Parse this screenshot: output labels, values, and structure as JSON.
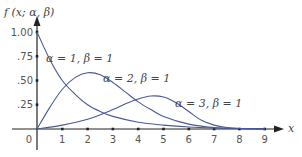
{
  "chart_data": {
    "type": "line",
    "title": "",
    "ylabel": "f (x; α, β)",
    "xlabel": "x",
    "xlim": [
      0,
      9
    ],
    "ylim": [
      0,
      1.1
    ],
    "grid": false,
    "legend_position": "inline annotations",
    "x_ticks": [
      "0",
      "1",
      "2",
      "3",
      "4",
      "5",
      "6",
      "7",
      "8",
      "9"
    ],
    "y_ticks": [
      ".25",
      ".50",
      ".75",
      "1.00"
    ],
    "y_tick_values": [
      0.25,
      0.5,
      0.75,
      1.0
    ],
    "series": [
      {
        "name": "α = 1, β = 1",
        "x": [
          0,
          0.5,
          1,
          1.5,
          2,
          2.5,
          3,
          4,
          5,
          6,
          7,
          8,
          9
        ],
        "values": [
          1.0,
          0.72,
          0.5,
          0.36,
          0.25,
          0.18,
          0.13,
          0.07,
          0.04,
          0.02,
          0.01,
          0.005,
          0.003
        ],
        "label_pos": [
          46,
          62
        ]
      },
      {
        "name": "α = 2, β = 1",
        "x": [
          0,
          0.5,
          1,
          1.5,
          2,
          2.5,
          3,
          3.5,
          4,
          4.5,
          5,
          6,
          7,
          8,
          9
        ],
        "values": [
          0,
          0.22,
          0.41,
          0.53,
          0.58,
          0.56,
          0.48,
          0.38,
          0.28,
          0.2,
          0.13,
          0.05,
          0.015,
          0.005,
          0
        ],
        "label_pos": [
          103,
          82
        ]
      },
      {
        "name": "α = 3, β = 1",
        "x": [
          0,
          1,
          2,
          3,
          3.5,
          4,
          4.5,
          5,
          5.5,
          6,
          6.5,
          7,
          7.5,
          8,
          9
        ],
        "values": [
          0,
          0.04,
          0.1,
          0.2,
          0.26,
          0.31,
          0.34,
          0.33,
          0.27,
          0.18,
          0.09,
          0.04,
          0.015,
          0.005,
          0
        ],
        "label_pos": [
          175,
          107
        ]
      }
    ],
    "origin_label": "0"
  },
  "colors": {
    "curve": "#4a5894",
    "axis": "#222222",
    "text": "#555555"
  }
}
